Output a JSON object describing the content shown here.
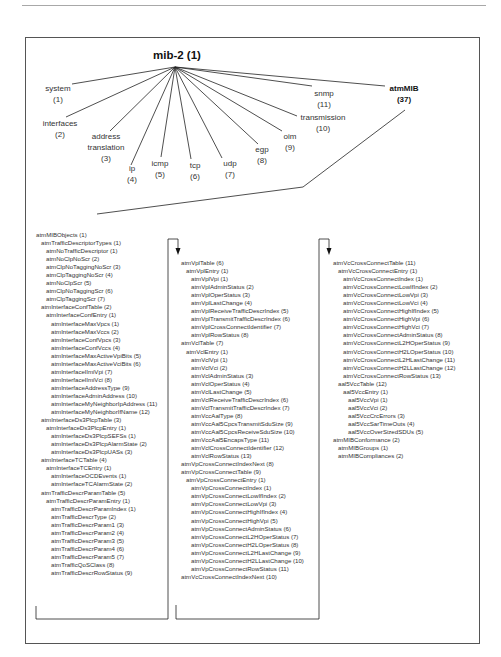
{
  "diagram": {
    "root": {
      "label": "mib-2 (1)"
    },
    "children": [
      {
        "name": "system",
        "num": "(1)"
      },
      {
        "name": "interfaces",
        "num": "(2)"
      },
      {
        "name": "address translation",
        "line1": "address",
        "line2": "translation",
        "num": "(3)"
      },
      {
        "name": "ip",
        "num": "(4)"
      },
      {
        "name": "icmp",
        "num": "(5)"
      },
      {
        "name": "tcp",
        "num": "(6)"
      },
      {
        "name": "udp",
        "num": "(7)"
      },
      {
        "name": "egp",
        "num": "(8)"
      },
      {
        "name": "oim",
        "num": "(9)"
      },
      {
        "name": "transmission",
        "num": "(10)"
      },
      {
        "name": "snmp",
        "num": "(11)"
      },
      {
        "name": "atmMIB",
        "num": "(37)"
      }
    ],
    "columns": [
      {
        "items": [
          {
            "level": 0,
            "text": "atmMIBObjects (1)"
          },
          {
            "level": 1,
            "text": "atmTrafficDescriptorTypes (1)"
          },
          {
            "level": 2,
            "text": "atmNoTrafficDescriptor (1)"
          },
          {
            "level": 2,
            "text": "atmNoClpNoScr (2)"
          },
          {
            "level": 2,
            "text": "atmClpNoTaggingNoScr (3)"
          },
          {
            "level": 2,
            "text": "atmClpTaggingNoScr (4)"
          },
          {
            "level": 2,
            "text": "atmNoClpScr (5)"
          },
          {
            "level": 2,
            "text": "atmClpNoTaggingScr (6)"
          },
          {
            "level": 2,
            "text": "atmClpTaggingScr (7)"
          },
          {
            "level": 1,
            "text": "atmInterfaceConfTable (2)"
          },
          {
            "level": 2,
            "text": "atmInterfaceConfEntry (1)"
          },
          {
            "level": 3,
            "text": "atmInterfaceMaxVpcs (1)"
          },
          {
            "level": 3,
            "text": "atmInterfaceMaxVccs (2)"
          },
          {
            "level": 3,
            "text": "atmInterfaceConfVpcs (3)"
          },
          {
            "level": 3,
            "text": "atmInterfaceConfVccs (4)"
          },
          {
            "level": 3,
            "text": "atmInterfaceMaxActiveVpiBits (5)"
          },
          {
            "level": 3,
            "text": "atmInterfaceMaxActiveVciBits (6)"
          },
          {
            "level": 3,
            "text": "atmInterfaceIlmiVpi (7)"
          },
          {
            "level": 3,
            "text": "atmInterfaceIlmiVci (8)"
          },
          {
            "level": 3,
            "text": "atmInterfaceAddressType (9)"
          },
          {
            "level": 3,
            "text": "atmInterfaceAdminAddress (10)"
          },
          {
            "level": 3,
            "text": "atmInterfaceMyNeighborIpAddress (11)"
          },
          {
            "level": 3,
            "text": "atmInterfaceMyNeighborIfName (12)"
          },
          {
            "level": 1,
            "text": "atmInterfaceDs3PlcpTable (3)"
          },
          {
            "level": 2,
            "text": "atmInterfaceDs3PlcpEntry (1)"
          },
          {
            "level": 3,
            "text": "atmInterfaceDs3PlcpSEFSs (1)"
          },
          {
            "level": 3,
            "text": "atmInterfaceDs3PlcpAlarmState (2)"
          },
          {
            "level": 3,
            "text": "atmInterfaceDs3PlcpUASs (3)"
          },
          {
            "level": 1,
            "text": "atmInterfaceTCTable (4)"
          },
          {
            "level": 2,
            "text": "atmInterfaceTCEntry (1)"
          },
          {
            "level": 3,
            "text": "atmInterfaceOCDEvents (1)"
          },
          {
            "level": 3,
            "text": "atmInterfaceTCAlarmState (2)"
          },
          {
            "level": 1,
            "text": "atmTrafficDescrParamTable (5)"
          },
          {
            "level": 2,
            "text": "atmTrafficDescrParamEntry (1)"
          },
          {
            "level": 3,
            "text": "atmTrafficDescrParamIndex (1)"
          },
          {
            "level": 3,
            "text": "atmTrafficDescrType (2)"
          },
          {
            "level": 3,
            "text": "atmTrafficDescrParam1 (3)"
          },
          {
            "level": 3,
            "text": "atmTrafficDescrParam2 (4)"
          },
          {
            "level": 3,
            "text": "atmTrafficDescrParam3 (5)"
          },
          {
            "level": 3,
            "text": "atmTrafficDescrParam4 (6)"
          },
          {
            "level": 3,
            "text": "atmTrafficDescrParam5 (7)"
          },
          {
            "level": 3,
            "text": "atmTrafficQoSClass (8)"
          },
          {
            "level": 3,
            "text": "atmTrafficDescrRowStatus (9)"
          }
        ]
      },
      {
        "items": [
          {
            "level": 0,
            "text": "atmVplTable (6)"
          },
          {
            "level": 1,
            "text": "atmVplEntry (1)"
          },
          {
            "level": 2,
            "text": "atmVplVpi (1)"
          },
          {
            "level": 2,
            "text": "atmVplAdminStatus (2)"
          },
          {
            "level": 2,
            "text": "atmVplOperStatus (3)"
          },
          {
            "level": 2,
            "text": "atmVplLastChange (4)"
          },
          {
            "level": 2,
            "text": "atmVplReceiveTrafficDescrIndex (5)"
          },
          {
            "level": 2,
            "text": "atmVplTransmitTrafficDescrIndex (6)"
          },
          {
            "level": 2,
            "text": "atmVplCrossConnectIdentifier (7)"
          },
          {
            "level": 2,
            "text": "atmVplRowStatus (8)"
          },
          {
            "level": 0,
            "text": "atmVclTable (7)"
          },
          {
            "level": 1,
            "text": "atmVclEntry (1)"
          },
          {
            "level": 2,
            "text": "atmVclVpi (1)"
          },
          {
            "level": 2,
            "text": "atmVclVci (2)"
          },
          {
            "level": 2,
            "text": "atmVclAdminStatus (3)"
          },
          {
            "level": 2,
            "text": "atmVclOperStatus (4)"
          },
          {
            "level": 2,
            "text": "atmVclLastChange (5)"
          },
          {
            "level": 2,
            "text": "atmVclReceiveTrafficDescrIndex (6)"
          },
          {
            "level": 2,
            "text": "atmVclTransmitTrafficDescrIndex (7)"
          },
          {
            "level": 2,
            "text": "atmVccAalType (8)"
          },
          {
            "level": 2,
            "text": "atmVccAal5CpcsTransmitSduSize (9)"
          },
          {
            "level": 2,
            "text": "atmVccAal5CpcsReceiveSduSize (10)"
          },
          {
            "level": 2,
            "text": "atmVccAal5EncapsType (11)"
          },
          {
            "level": 2,
            "text": "atmVclCrossConnectIdentifier (12)"
          },
          {
            "level": 2,
            "text": "atmVclRowStatus (13)"
          },
          {
            "level": 0,
            "text": "atmVpCrossConnectIndexNext (8)"
          },
          {
            "level": 0,
            "text": "atmVpCrossConnectTable (9)"
          },
          {
            "level": 1,
            "text": "atmVpCrossConnectEntry (1)"
          },
          {
            "level": 2,
            "text": "atmVpCrossConnectIndex (1)"
          },
          {
            "level": 2,
            "text": "atmVpCrossConnectLowIfIndex (2)"
          },
          {
            "level": 2,
            "text": "atmVpCrossConnectLowVpi (3)"
          },
          {
            "level": 2,
            "text": "atmVpCrossConnectHighIfIndex (4)"
          },
          {
            "level": 2,
            "text": "atmVpCrossConnectHighVpi (5)"
          },
          {
            "level": 2,
            "text": "atmVpCrossConnectAdminStatus (6)"
          },
          {
            "level": 2,
            "text": "atmVpCrossConnectL2HOperStatus (7)"
          },
          {
            "level": 2,
            "text": "atmVpCrossConnectH2LOperStatus (8)"
          },
          {
            "level": 2,
            "text": "atmVpCrossConnectL2HLastChange (9)"
          },
          {
            "level": 2,
            "text": "atmVpCrossConnectH2LLastChange (10)"
          },
          {
            "level": 2,
            "text": "atmVpCrossConnectRowStatus (11)"
          },
          {
            "level": 0,
            "text": "atmVcCrossConnectIndexNext (10)"
          }
        ]
      },
      {
        "items": [
          {
            "level": 0,
            "text": "atmVcCrossConnectTable (11)"
          },
          {
            "level": 1,
            "text": "atmVcCrossConnectEntry (1)"
          },
          {
            "level": 2,
            "text": "atmVcCrossConnectIndex (1)"
          },
          {
            "level": 2,
            "text": "atmVcCrossConnectLowIfIndex (2)"
          },
          {
            "level": 2,
            "text": "atmVcCrossConnectLowVpi (3)"
          },
          {
            "level": 2,
            "text": "atmVcCrossConnectLowVci (4)"
          },
          {
            "level": 2,
            "text": "atmVcCrossConnectHighIfIndex (5)"
          },
          {
            "level": 2,
            "text": "atmVcCrossConnectHighVpi (6)"
          },
          {
            "level": 2,
            "text": "atmVcCrossConnectHighVci (7)"
          },
          {
            "level": 2,
            "text": "atmVcCrossConnectAdminStatus (8)"
          },
          {
            "level": 2,
            "text": "atmVcCrossConnectL2HOperStatus (9)"
          },
          {
            "level": 2,
            "text": "atmVcCrossConnectH2LOperStatus (10)"
          },
          {
            "level": 2,
            "text": "atmVcCrossConnectL2HLastChange (11)"
          },
          {
            "level": 2,
            "text": "atmVcCrossConnectH2LLastChange (12)"
          },
          {
            "level": 2,
            "text": "atmVcCrossConnectRowStatus (13)"
          },
          {
            "level": 1,
            "text": "aal5VccTable (12)"
          },
          {
            "level": 2,
            "text": "aal5VccEntry (1)"
          },
          {
            "level": 3,
            "text": "aal5VccVpi (1)"
          },
          {
            "level": 3,
            "text": "aal5VccVci (2)"
          },
          {
            "level": 3,
            "text": "aal5VccCrcErrors (3)"
          },
          {
            "level": 3,
            "text": "aal5VccSarTimeOuts (4)"
          },
          {
            "level": 3,
            "text": "aal5VccOverSizedSDUs (5)"
          },
          {
            "level": 0,
            "text": "atmMIBConformance (2)"
          },
          {
            "level": 1,
            "text": "atmMIBGroups (1)"
          },
          {
            "level": 1,
            "text": "atmMIBCompliances (2)"
          }
        ]
      }
    ]
  }
}
